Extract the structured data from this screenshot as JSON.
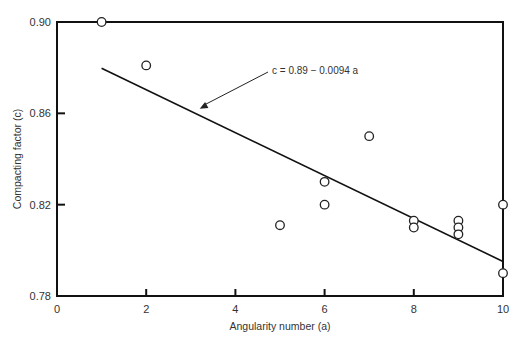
{
  "chart_data": {
    "type": "scatter",
    "title": "",
    "xlabel": "Angularity number (a)",
    "ylabel": "Compacting factor (c)",
    "xlim": [
      0,
      10
    ],
    "ylim": [
      0.78,
      0.9
    ],
    "x_ticks": [
      0,
      2,
      4,
      6,
      8,
      10
    ],
    "x_tick_labels": [
      "0",
      "2",
      "4",
      "6",
      "8",
      "10"
    ],
    "y_ticks": [
      0.78,
      0.82,
      0.86,
      0.9
    ],
    "y_tick_labels": [
      "0.78",
      "0.82",
      "0.86",
      "0.90"
    ],
    "grid": false,
    "legend": null,
    "series": [
      {
        "name": "Observations",
        "marker": "open-circle",
        "points": [
          {
            "x": 1,
            "y": 0.9
          },
          {
            "x": 2,
            "y": 0.881
          },
          {
            "x": 5,
            "y": 0.811
          },
          {
            "x": 6,
            "y": 0.83
          },
          {
            "x": 6,
            "y": 0.82
          },
          {
            "x": 7,
            "y": 0.85
          },
          {
            "x": 8,
            "y": 0.813
          },
          {
            "x": 8,
            "y": 0.81
          },
          {
            "x": 9,
            "y": 0.813
          },
          {
            "x": 9,
            "y": 0.81
          },
          {
            "x": 9,
            "y": 0.807
          },
          {
            "x": 10,
            "y": 0.82
          },
          {
            "x": 10,
            "y": 0.79
          }
        ]
      },
      {
        "name": "Regression line",
        "type": "line",
        "equation": "c = 0.89 - 0.0094 a",
        "intercept": 0.89,
        "slope": -0.0094,
        "x_range": [
          1,
          10
        ]
      }
    ],
    "annotations": [
      {
        "text": "c = 0.89 − 0.0094 a",
        "arrow_to": {
          "x": 3.2,
          "y": 0.862
        }
      }
    ]
  }
}
